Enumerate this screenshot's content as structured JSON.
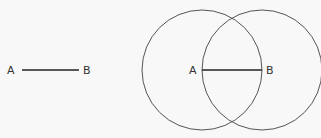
{
  "diagram": {
    "background": "#f8f8f8",
    "stroke_color": "#555555",
    "segment": {
      "label_a": "A",
      "label_b": "B",
      "a": [
        22,
        70
      ],
      "b": [
        79,
        70
      ]
    },
    "construction": {
      "label_a": "A",
      "label_b": "B",
      "center_a": [
        202,
        70
      ],
      "center_b": [
        262,
        70
      ],
      "radius": 60
    }
  }
}
